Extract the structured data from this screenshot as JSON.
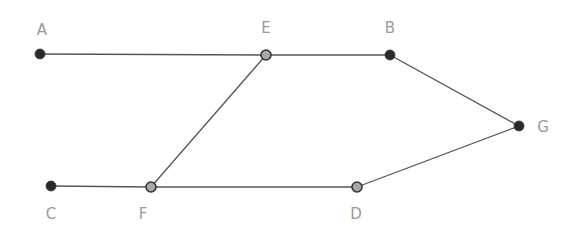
{
  "diagram": {
    "type": "graph",
    "colors": {
      "edge": "#555555",
      "node_dark": "#2a2a2a",
      "node_light": "#a8a8a8",
      "label": "#9a9a9a"
    },
    "nodes": [
      {
        "id": "A",
        "label": "A",
        "x": 40,
        "y": 54,
        "lx": 42,
        "ly": 35,
        "style": "dark"
      },
      {
        "id": "E",
        "label": "E",
        "x": 266,
        "y": 55,
        "lx": 266,
        "ly": 33,
        "style": "light"
      },
      {
        "id": "B",
        "label": "B",
        "x": 390,
        "y": 55,
        "lx": 390,
        "ly": 33,
        "style": "dark"
      },
      {
        "id": "G",
        "label": "G",
        "x": 519,
        "y": 126,
        "lx": 543,
        "ly": 132,
        "style": "dark"
      },
      {
        "id": "C",
        "label": "C",
        "x": 51,
        "y": 186,
        "lx": 51,
        "ly": 219,
        "style": "dark"
      },
      {
        "id": "F",
        "label": "F",
        "x": 151,
        "y": 187,
        "lx": 143,
        "ly": 219,
        "style": "light"
      },
      {
        "id": "D",
        "label": "D",
        "x": 357,
        "y": 187,
        "lx": 356,
        "ly": 219,
        "style": "light"
      }
    ],
    "edges": [
      [
        "A",
        "E"
      ],
      [
        "E",
        "B"
      ],
      [
        "B",
        "G"
      ],
      [
        "G",
        "D"
      ],
      [
        "D",
        "F"
      ],
      [
        "F",
        "C"
      ],
      [
        "F",
        "E"
      ]
    ]
  }
}
